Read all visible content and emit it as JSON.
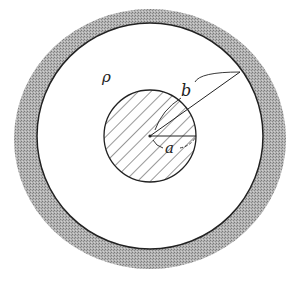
{
  "diagram": {
    "labels": {
      "rho": "ρ",
      "b": "b",
      "a": "a"
    },
    "colors": {
      "ring": "#9a9a9a",
      "line": "#222222",
      "background": "#ffffff"
    }
  }
}
